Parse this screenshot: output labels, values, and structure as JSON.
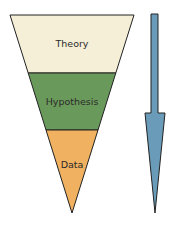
{
  "diagram": {
    "type": "inverted-funnel",
    "layers": [
      {
        "label": "Theory",
        "color": "#f5efd8"
      },
      {
        "label": "Hypothesis",
        "color": "#6a9a5b"
      },
      {
        "label": "Data",
        "color": "#f0b160"
      }
    ],
    "arrow": {
      "direction": "down",
      "color": "#6a9bb8"
    }
  }
}
